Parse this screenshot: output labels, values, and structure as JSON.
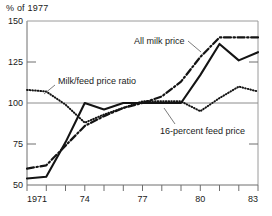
{
  "chart_data": {
    "type": "line",
    "title": "",
    "ylabel": "% of 1977",
    "xlabel": "",
    "ylim": [
      50,
      150
    ],
    "xlim": [
      1971,
      1983
    ],
    "yticks": [
      50,
      75,
      100,
      125,
      150
    ],
    "ytick_labels": [
      "50",
      "75",
      "100",
      "125",
      "150"
    ],
    "xticks": [
      1971,
      1972,
      1973,
      1974,
      1975,
      1976,
      1977,
      1978,
      1979,
      1980,
      1981,
      1982,
      1983
    ],
    "xtick_labels": [
      "1971",
      "",
      "",
      "74",
      "",
      "",
      "77",
      "",
      "",
      "80",
      "",
      "",
      "83"
    ],
    "grid": false,
    "reference_line_y": 100,
    "legend_position": "inline-annotations",
    "x": [
      1971,
      1972,
      1973,
      1974,
      1975,
      1976,
      1977,
      1978,
      1979,
      1980,
      1981,
      1982,
      1983
    ],
    "series": [
      {
        "name": "All milk price",
        "style": "dash-dot",
        "color": "#141414",
        "values": [
          60,
          62,
          74,
          86,
          92,
          97,
          100,
          104,
          113,
          128,
          140,
          140,
          140
        ]
      },
      {
        "name": "16-percent feed price",
        "style": "solid",
        "color": "#141414",
        "values": [
          54,
          55,
          76,
          100,
          96,
          100,
          100,
          100,
          100,
          117,
          136,
          126,
          131
        ]
      },
      {
        "name": "Milk/feed price ratio",
        "style": "dotted",
        "color": "#141414",
        "values": [
          108,
          107,
          99,
          88,
          93,
          97,
          101,
          101,
          101,
          95,
          103,
          110,
          107
        ]
      }
    ],
    "annotations": [
      {
        "text": "All milk price",
        "x_px": 134,
        "y_px": 44,
        "anchor": "start"
      },
      {
        "text": "Milk/feed price ratio",
        "x_px": 56,
        "y_px": 84,
        "anchor": "start"
      },
      {
        "text": "16-percent feed price",
        "x_px": 160,
        "y_px": 131,
        "anchor": "start"
      }
    ]
  },
  "axis": {
    "y_title": "% of 1977",
    "y_labels": [
      "150",
      "125",
      "100",
      "75",
      "50"
    ],
    "x_labels": [
      "1971",
      "74",
      "77",
      "80",
      "83"
    ]
  },
  "labels": {
    "all_milk_price": "All milk price",
    "milk_feed_price_ratio": "Milk/feed price ratio",
    "sixteen_percent_feed_price": "16-percent feed price"
  },
  "colors": {
    "ink": "#141414",
    "axis": "#6e6e6e",
    "reference": "#8c8c8c",
    "background": "#ffffff"
  }
}
